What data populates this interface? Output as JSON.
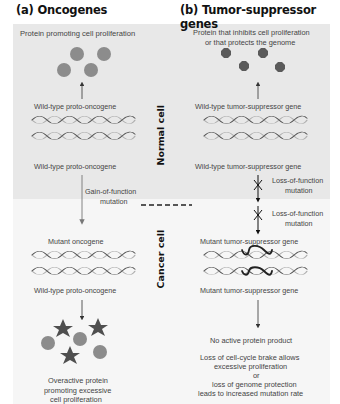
{
  "panels": {
    "a": {
      "heading": "(a) Oncogenes",
      "protein_label": "Protein promoting cell proliferation",
      "gene_top_normal": "Wild-type proto-oncogene",
      "gene_bottom_normal": "Wild-type proto-oncogene",
      "mutation_label_1": "Gain-of-function",
      "mutation_label_2": "mutation",
      "gene_top_cancer": "Mutant oncogene",
      "gene_bottom_cancer": "Wild-type proto-oncogene",
      "result_1": "Overactive protein",
      "result_2": "promoting excessive",
      "result_3": "cell proliferation"
    },
    "b": {
      "heading": "(b) Tumor-suppressor genes",
      "protein_label_1": "Protein that inhibits cell proliferation",
      "protein_label_2": "or that protects the genome",
      "gene_top_normal": "Wild-type tumor-suppressor gene",
      "gene_bottom_normal": "Wild-type tumor-suppressor gene",
      "mutation1_label_1": "Loss-of-function",
      "mutation1_label_2": "mutation",
      "mutation2_label_1": "Loss-of-function",
      "mutation2_label_2": "mutation",
      "gene_top_cancer": "Mutant tumor-suppressor gene",
      "gene_bottom_cancer": "Mutant tumor-suppressor gene",
      "no_product": "No active protein product",
      "result_1": "Loss of cell-cycle brake allows",
      "result_2": "excessive proliferation",
      "result_3": "or",
      "result_4": "loss of genome protection",
      "result_5": "leads to increased mutation rate"
    }
  },
  "side_labels": {
    "normal": "Normal cell",
    "cancer": "Cancer cell"
  },
  "colors": {
    "normal_bg": "#e8e8e8",
    "cancer_bg": "#f6f6f6",
    "protein_circle": "#8c8c8c",
    "suppressor_protein": "#5a5a5a",
    "star": "#4f4f4f",
    "dna_dark": "#555555",
    "dna_light": "#b0b0b0",
    "dna_mutant": "#222222"
  },
  "icons": {
    "protein_a": "grey-circle",
    "protein_b": "dark-octagon",
    "mutant_protein": "dark-star",
    "mutation_mark": "x-cross-on-arrow"
  }
}
